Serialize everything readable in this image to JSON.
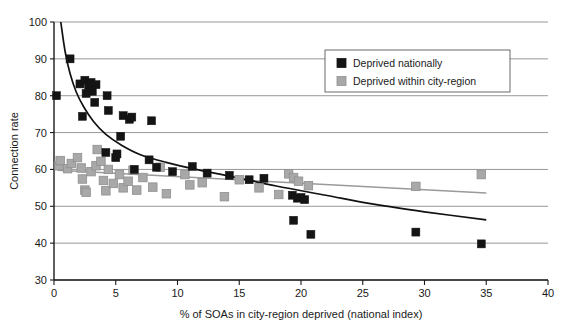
{
  "chart_data": {
    "type": "scatter",
    "title": "",
    "xlabel": "% of SOAs in city-region deprived (national index)",
    "ylabel": "Connection rate",
    "xlim": [
      0,
      40
    ],
    "ylim": [
      30,
      100
    ],
    "xticks": [
      0,
      5,
      10,
      15,
      20,
      25,
      30,
      35,
      40
    ],
    "xtick_labels": [
      "0",
      "5",
      "10",
      "15",
      "20",
      "25",
      "30",
      "35",
      "40"
    ],
    "yticks": [
      30,
      40,
      50,
      60,
      70,
      80,
      90,
      100
    ],
    "ytick_labels": [
      "30",
      "40",
      "50",
      "60",
      "70",
      "80",
      "90",
      "100"
    ],
    "grid": "horizontal",
    "legend_position": "top-right",
    "colors": {
      "deprived_nationally": "#141414",
      "deprived_within_city_region": "#a8a8a8",
      "trend_nationally": "#111111",
      "trend_city_region": "#9a9a9a",
      "gridline": "#8c8c8c",
      "axis": "#1a1a1a",
      "background": "#ffffff"
    },
    "series": [
      {
        "name": "Deprived nationally",
        "marker": "square",
        "color": "#141414",
        "points": [
          [
            1.3,
            90.0
          ],
          [
            0.2,
            80.0
          ],
          [
            2.1,
            83.2
          ],
          [
            2.5,
            84.2
          ],
          [
            2.8,
            82.4
          ],
          [
            3.0,
            83.6
          ],
          [
            3.1,
            81.2
          ],
          [
            3.4,
            83.0
          ],
          [
            2.6,
            80.6
          ],
          [
            3.3,
            78.2
          ],
          [
            4.3,
            80.0
          ],
          [
            2.3,
            74.4
          ],
          [
            4.4,
            76.0
          ],
          [
            5.6,
            74.6
          ],
          [
            6.1,
            73.6
          ],
          [
            6.3,
            74.2
          ],
          [
            7.9,
            73.2
          ],
          [
            5.4,
            69.0
          ],
          [
            4.2,
            64.6
          ],
          [
            5.0,
            63.2
          ],
          [
            5.1,
            64.2
          ],
          [
            7.7,
            62.6
          ],
          [
            6.5,
            60.0
          ],
          [
            8.3,
            60.6
          ],
          [
            9.6,
            59.4
          ],
          [
            11.2,
            60.8
          ],
          [
            12.4,
            59.0
          ],
          [
            14.2,
            58.4
          ],
          [
            15.8,
            57.2
          ],
          [
            17.0,
            57.6
          ],
          [
            19.3,
            53.0
          ],
          [
            19.7,
            52.2
          ],
          [
            20.0,
            52.4
          ],
          [
            20.3,
            51.8
          ],
          [
            19.4,
            46.2
          ],
          [
            20.8,
            42.4
          ],
          [
            29.3,
            43.0
          ],
          [
            34.6,
            39.8
          ]
        ]
      },
      {
        "name": "Deprived within city-region",
        "marker": "square",
        "color": "#a8a8a8",
        "points": [
          [
            0.4,
            61.0
          ],
          [
            0.5,
            62.4
          ],
          [
            1.1,
            60.2
          ],
          [
            1.4,
            61.6
          ],
          [
            1.9,
            63.2
          ],
          [
            2.2,
            60.4
          ],
          [
            2.3,
            57.4
          ],
          [
            2.5,
            54.4
          ],
          [
            2.6,
            53.8
          ],
          [
            3.0,
            59.4
          ],
          [
            3.4,
            61.0
          ],
          [
            3.5,
            65.4
          ],
          [
            3.8,
            62.2
          ],
          [
            4.0,
            57.0
          ],
          [
            4.2,
            54.2
          ],
          [
            4.4,
            60.0
          ],
          [
            4.8,
            56.2
          ],
          [
            5.3,
            58.6
          ],
          [
            5.6,
            55.0
          ],
          [
            6.0,
            56.8
          ],
          [
            6.4,
            59.8
          ],
          [
            6.7,
            54.4
          ],
          [
            7.2,
            57.8
          ],
          [
            8.0,
            55.2
          ],
          [
            8.6,
            60.6
          ],
          [
            9.1,
            53.4
          ],
          [
            10.6,
            58.6
          ],
          [
            11.0,
            55.8
          ],
          [
            12.0,
            56.4
          ],
          [
            13.8,
            52.6
          ],
          [
            15.0,
            57.2
          ],
          [
            16.6,
            55.0
          ],
          [
            18.2,
            53.2
          ],
          [
            19.0,
            58.8
          ],
          [
            19.4,
            57.8
          ],
          [
            19.8,
            56.8
          ],
          [
            20.6,
            55.6
          ],
          [
            29.3,
            55.4
          ],
          [
            34.6,
            58.6
          ]
        ]
      }
    ],
    "trendlines": [
      {
        "name": "Deprived nationally trend",
        "style": "curve",
        "color": "#111111",
        "points": [
          [
            0.55,
            100.0
          ],
          [
            0.9,
            92.0
          ],
          [
            1.3,
            86.0
          ],
          [
            1.8,
            81.0
          ],
          [
            2.4,
            77.0
          ],
          [
            3.2,
            73.0
          ],
          [
            4.2,
            69.5
          ],
          [
            5.5,
            66.5
          ],
          [
            7.0,
            64.0
          ],
          [
            9.0,
            62.0
          ],
          [
            11.5,
            60.0
          ],
          [
            14.5,
            58.0
          ],
          [
            18.0,
            55.5
          ],
          [
            22.0,
            53.0
          ],
          [
            26.0,
            50.5
          ],
          [
            30.0,
            48.5
          ],
          [
            35.0,
            46.3
          ]
        ]
      },
      {
        "name": "Deprived within city-region trend",
        "style": "line",
        "color": "#9a9a9a",
        "points": [
          [
            0.3,
            59.8
          ],
          [
            35.0,
            53.6
          ]
        ]
      }
    ],
    "legend": [
      {
        "label": "Deprived nationally",
        "swatch": "#141414"
      },
      {
        "label": "Deprived within city-region",
        "swatch": "#a8a8a8"
      }
    ]
  }
}
